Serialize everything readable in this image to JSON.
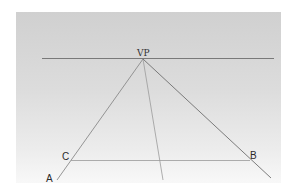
{
  "diagram": {
    "labels": {
      "vp": "VP",
      "a": "A",
      "b": "B",
      "c": "C"
    },
    "colors": {
      "background": "#d6d6d6",
      "line": "#7a7a7a"
    }
  }
}
